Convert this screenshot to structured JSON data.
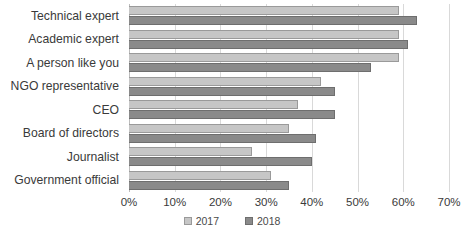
{
  "chart_data": {
    "type": "bar",
    "orientation": "horizontal",
    "title": "",
    "subtitle": "",
    "xlabel": "",
    "ylabel": "",
    "categories": [
      "Technical expert",
      "Academic expert",
      "A person like you",
      "NGO representative",
      "CEO",
      "Board of directors",
      "Journalist",
      "Government official"
    ],
    "series": [
      {
        "name": "2017",
        "color": "#c6c6c6",
        "values": [
          59,
          59,
          59,
          42,
          37,
          35,
          27,
          31
        ]
      },
      {
        "name": "2018",
        "color": "#8a8a8a",
        "values": [
          63,
          61,
          53,
          45,
          45,
          41,
          40,
          35
        ]
      }
    ],
    "xlim": [
      0,
      70
    ],
    "xticks": [
      0,
      10,
      20,
      30,
      40,
      50,
      60,
      70
    ],
    "xtick_labels": [
      "0%",
      "10%",
      "20%",
      "30%",
      "40%",
      "50%",
      "60%",
      "70%"
    ],
    "grid": true,
    "grid_axis": "x",
    "legend_position": "bottom"
  },
  "legend": {
    "items": [
      {
        "label": "2017",
        "swatch": "legend-swatch-2017"
      },
      {
        "label": "2018",
        "swatch": "legend-swatch-2018"
      }
    ]
  }
}
